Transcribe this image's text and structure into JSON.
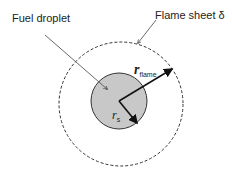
{
  "diagram": {
    "labels": {
      "fuel_droplet": "Fuel droplet",
      "flame_sheet": "Flame sheet δ",
      "r_flame_main": "r",
      "r_flame_sub": "flame",
      "r_s_main": "r",
      "r_s_sub": "s"
    },
    "colors": {
      "droplet_fill": "#c8c8c8",
      "stroke": "#222222"
    }
  }
}
